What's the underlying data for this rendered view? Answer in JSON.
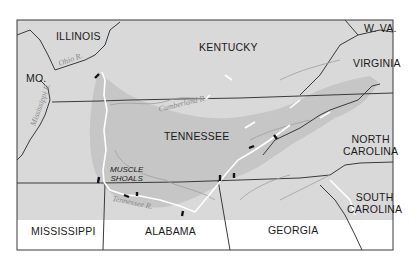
{
  "map": {
    "title": "Tennessee Valley region",
    "colors": {
      "land": "#d9d9d9",
      "watershed": "#c4c4c4",
      "border": "#3a3a3a",
      "river": "#9a9a9a",
      "reservoir": "#ffffff",
      "dam": "#111111"
    },
    "states": [
      {
        "id": "illinois",
        "label": "ILLINOIS"
      },
      {
        "id": "kentucky",
        "label": "KENTUCKY"
      },
      {
        "id": "west-virginia",
        "label": "W. VA."
      },
      {
        "id": "virginia",
        "label": "VIRGINIA"
      },
      {
        "id": "missouri",
        "label": "MO."
      },
      {
        "id": "tennessee",
        "label": "TENNESSEE"
      },
      {
        "id": "north-carolina",
        "label_line1": "NORTH",
        "label_line2": "CAROLINA"
      },
      {
        "id": "south-carolina",
        "label_line1": "SOUTH",
        "label_line2": "CAROLINA"
      },
      {
        "id": "mississippi",
        "label": "MISSISSIPPI"
      },
      {
        "id": "alabama",
        "label": "ALABAMA"
      },
      {
        "id": "georgia",
        "label": "GEORGIA"
      }
    ],
    "rivers": [
      {
        "id": "ohio",
        "label": "Ohio R."
      },
      {
        "id": "mississippi",
        "label": "Mississippi R."
      },
      {
        "id": "cumberland",
        "label": "Cumberland R."
      },
      {
        "id": "tennessee",
        "label": "Tennessee R."
      }
    ],
    "places": [
      {
        "id": "muscle-shoals",
        "label_line1": "MUSCLE",
        "label_line2": "SHOALS"
      }
    ]
  }
}
